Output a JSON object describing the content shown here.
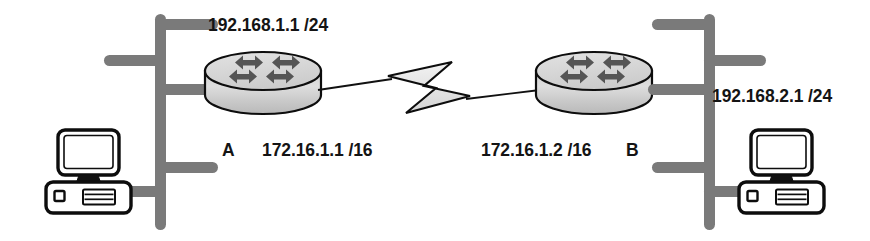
{
  "diagram": {
    "title": "Two-router internetwork with point-to-point WAN link",
    "type": "network-topology",
    "background_color": "#ffffff",
    "colors": {
      "cable": "#7a7a7a",
      "bus": "#7a7a7a",
      "outline": "#0d0d0d",
      "router_body": "#dcdcdc",
      "router_top": "#d2d2d2",
      "router_arrow": "#555555",
      "wan_link_fill": "#e8e8e8",
      "text": "#141414",
      "pc_fill": "#ffffff"
    },
    "labels": {
      "left_lan_ip": "192.168.1.1 /24",
      "left_router_name": "A",
      "left_wan_ip": "172.16.1.1 /16",
      "right_wan_ip": "172.16.1.2 /16",
      "right_router_name": "B",
      "right_lan_ip": "192.168.2.1 /24"
    },
    "nodes": {
      "left_router": {
        "name": "A",
        "icon": "router-icon",
        "lan_address": "192.168.1.1 /24",
        "wan_address": "172.16.1.1 /16"
      },
      "right_router": {
        "name": "B",
        "icon": "router-icon",
        "lan_address": "192.168.2.1 /24",
        "wan_address": "172.16.1.2 /16"
      },
      "left_pc": {
        "icon": "desktop-computer-icon"
      },
      "right_pc": {
        "icon": "desktop-computer-icon"
      },
      "left_bus": {
        "icon": "ethernet-bus-icon"
      },
      "right_bus": {
        "icon": "ethernet-bus-icon"
      },
      "wan_link": {
        "icon": "lightning-bolt-icon"
      }
    }
  }
}
